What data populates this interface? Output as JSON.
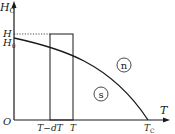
{
  "diagram": {
    "y_axis_label": "H",
    "y_axis_subscript": "C",
    "x_axis_label": "T",
    "origin_label": "O",
    "h_label": "H",
    "h0_label": "H",
    "h0_subscript": "0",
    "tick_t_minus_dt": "T−dT",
    "tick_t": "T",
    "tc_label": "T",
    "tc_subscript": "C",
    "region_normal": "n",
    "region_super": "s"
  },
  "colors": {
    "line": "#1a1a1a",
    "background": "#ffffff"
  }
}
